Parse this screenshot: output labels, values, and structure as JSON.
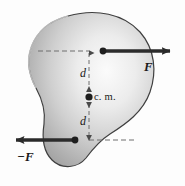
{
  "figure": {
    "name": "force-couple-on-rigid-body",
    "body_shape": "irregular-blob",
    "labels": {
      "force_positive": "F",
      "force_negative": "−F",
      "distance_upper": "d",
      "distance_lower": "d",
      "center_of_mass": "c. m."
    },
    "caption": "",
    "colors": {
      "blob_light": "#f2f2f2",
      "blob_mid": "#c9c9c9",
      "blob_dark": "#9b9b9b",
      "outline": "#3a3a3a",
      "arrow": "#2b2b2b",
      "dashed": "#6e6e6e",
      "text": "#1a1a1a",
      "background": "#fdfdfd"
    },
    "geometry": {
      "cm_point": [
        89,
        97
      ],
      "upper_force_point": [
        103,
        51
      ],
      "lower_force_point": [
        75,
        140
      ],
      "upper_arrow_tip": [
        178,
        51
      ],
      "lower_arrow_tip": [
        8,
        140
      ],
      "moment_arm_d": "d"
    }
  }
}
